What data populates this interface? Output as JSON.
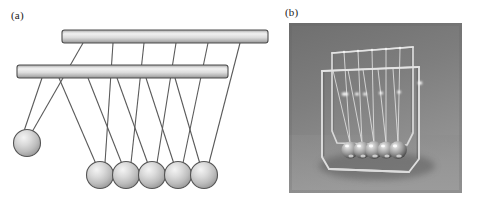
{
  "figure": {
    "panels": [
      {
        "id": "a",
        "label": "(a)",
        "kind": "schematic-diagram",
        "description": "Line drawing of a Newton's cradle showing two horizontal support bars, five suspended spheres at rest, and one raised sphere pulled back on the left.",
        "support_bars": [
          {
            "name": "rear-support-bar",
            "x": 62,
            "y": 30,
            "width": 206,
            "height": 13,
            "fill_light": "#e8e8e8",
            "fill_dark": "#9a9a9a",
            "stroke": "#4d4d4d"
          },
          {
            "name": "front-support-bar",
            "x": 17,
            "y": 65,
            "width": 211,
            "height": 13,
            "fill_light": "#e8e8e8",
            "fill_dark": "#9a9a9a",
            "stroke": "#4d4d4d"
          }
        ],
        "spheres": [
          {
            "name": "raised-sphere",
            "cx": 27,
            "cy": 143,
            "r": 13.5,
            "state": "raised"
          },
          {
            "name": "resting-sphere-1",
            "cx": 100,
            "cy": 175,
            "r": 13.5,
            "state": "at-rest"
          },
          {
            "name": "resting-sphere-2",
            "cx": 126,
            "cy": 175,
            "r": 13.5,
            "state": "at-rest"
          },
          {
            "name": "resting-sphere-3",
            "cx": 152,
            "cy": 175,
            "r": 13.5,
            "state": "at-rest"
          },
          {
            "name": "resting-sphere-4",
            "cx": 178,
            "cy": 175,
            "r": 13.5,
            "state": "at-rest"
          },
          {
            "name": "resting-sphere-5",
            "cx": 204,
            "cy": 175,
            "r": 13.5,
            "state": "at-rest"
          }
        ],
        "sphere_count_at_rest": 5,
        "sphere_count_raised": 1,
        "colors": {
          "sphere_highlight": "#f2f2f2",
          "sphere_mid": "#c9c9c9",
          "sphere_shadow": "#8e8e8e",
          "sphere_outline": "#555555",
          "string": "#5a5a5a",
          "bar_outline": "#4d4d4d"
        }
      },
      {
        "id": "b",
        "label": "(b)",
        "kind": "photograph",
        "description": "Black-and-white photograph of a real Newton's cradle desk toy: five polished steel balls hanging on thin wires from a bent wire frame, resting on a grey surface.",
        "x": 289,
        "y": 23,
        "width": 173,
        "height": 170,
        "ball_count": 5,
        "colors": {
          "background": "#7c7c7c",
          "surface": "#8b8b8b",
          "frame_wire": "#d8d8d8",
          "ball_body": "#b9b9b9",
          "ball_highlight": "#f0f0f0",
          "ball_shadow": "#4a4a4a"
        }
      }
    ]
  }
}
